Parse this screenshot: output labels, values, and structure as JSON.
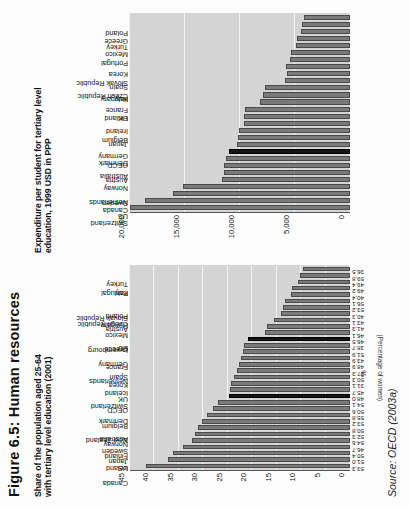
{
  "figure": {
    "title": "Figure 6.5: Human resources",
    "source": "Source: OECD (2003a)"
  },
  "chart_data": [
    {
      "id": "expenditure",
      "type": "bar",
      "title": "Expenditure per student for tertiary level\neducation, 1999 USD in PPP",
      "xlabel": "",
      "ylabel": "",
      "ylim": [
        0,
        20000
      ],
      "grid": true,
      "orientation": "vertical",
      "ticks": [
        "0",
        "5,000",
        "10,000",
        "15,000",
        "20,000"
      ],
      "tick_values": [
        0,
        5000,
        10000,
        15000,
        20000
      ],
      "categories": [
        "US",
        "Switzerland",
        "Canada",
        "Sweden",
        "Netherlands",
        "Norway",
        "Austria",
        "Australia",
        "OECD",
        "Denmark",
        "Germany",
        "Japan",
        "Belgium",
        "Ireland",
        "UK",
        "Finland",
        "France",
        "Italy",
        "Hungary",
        "Spain",
        "Czech Republic",
        "Korea",
        "Slovak Republic",
        "Portugal",
        "Mexico",
        "Turkey",
        "Greece",
        "Poland"
      ],
      "values": [
        20500,
        18600,
        16100,
        15200,
        11600,
        11450,
        11450,
        11250,
        11000,
        10300,
        10200,
        10050,
        9650,
        9600,
        9550,
        8150,
        7950,
        7700,
        5900,
        5750,
        5800,
        5450,
        5350,
        4950,
        4850,
        4450,
        4350,
        4150
      ],
      "highlight": [
        "OECD"
      ]
    },
    {
      "id": "tertiary-share",
      "type": "bar",
      "title": "Share of the population aged 25-64\nwith tertiary level education (2001)",
      "xlabel": "%",
      "ylabel": "(Percentage of women)",
      "ylim": [
        0,
        45
      ],
      "grid": true,
      "orientation": "vertical",
      "ticks": [
        "0",
        "5",
        "10",
        "15",
        "20",
        "25",
        "30",
        "35",
        "40",
        "45"
      ],
      "tick_values": [
        0,
        5,
        10,
        15,
        20,
        25,
        30,
        35,
        40,
        45
      ],
      "categories": [
        "Canada",
        "US",
        "Ireland",
        "Japan",
        "Finland",
        "Sweden",
        "Norway",
        "Australia",
        "New Zealand",
        "Belgium",
        "Denmark",
        "OECD",
        "UK",
        "Switzerland",
        "Iceland",
        "Korea",
        "Spain",
        "Netherlands",
        "France",
        "Germany",
        "EU",
        "Greece",
        "Luxembourg",
        "Mexico",
        "Austria",
        "Hungary",
        "Poland",
        "Czech Republic",
        "Slovak Republic",
        "Italy",
        "Portugal",
        "Turkey"
      ],
      "values": [
        41.7,
        37.3,
        36.3,
        34.1,
        32.4,
        31.8,
        31.0,
        30.2,
        29.3,
        28.0,
        27.0,
        24.8,
        24.6,
        24.3,
        23.8,
        23.1,
        22.7,
        22.3,
        21.9,
        21.6,
        20.9,
        17.3,
        17.0,
        15.5,
        14.2,
        13.8,
        13.3,
        12.1,
        11.8,
        10.6,
        10.2,
        9.6
      ],
      "data_labels": [
        "53.3",
        "51.0",
        "50.4",
        "46.7",
        "54.6",
        "52.3",
        "50.8",
        "53.2",
        "55.8",
        "50.6",
        "54.1",
        "48.0",
        "45.7",
        "31.1",
        "50.3",
        "37.3",
        "48.9",
        "43.9",
        "51.9",
        "38.7",
        "46.5",
        "46.1",
        "41.3",
        "43.1",
        "40.3",
        "53.2",
        "56.1",
        "40.4",
        "49.2",
        "49.4",
        "59.8",
        "36.5"
      ],
      "highlight": [
        "OECD",
        "EU"
      ]
    }
  ]
}
